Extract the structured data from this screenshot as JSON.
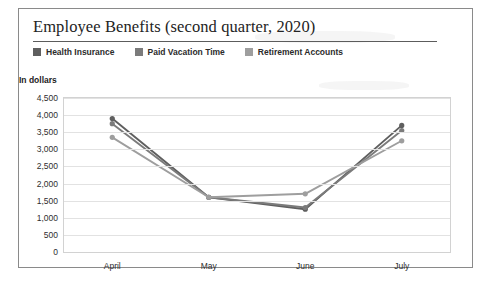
{
  "figure": {
    "title": "Employee Benefits (second quarter, 2020)",
    "axis_note": "In dollars"
  },
  "colors": {
    "health_insurance": "#5f5f5f",
    "paid_vacation_time": "#7b7b7b",
    "retirement_accounts": "#9e9e9e",
    "gridline": "#e2e2e2",
    "plot_border": "#d2d2d2",
    "frame_border": "#8a8a8a",
    "title_rule": "#5c5c5c",
    "text": "#2e2e2e"
  },
  "legend": {
    "position": "top",
    "items": [
      {
        "label": "Health Insurance",
        "color": "#5f5f5f"
      },
      {
        "label": "Paid Vacation Time",
        "color": "#7b7b7b"
      },
      {
        "label": "Retirement Accounts",
        "color": "#9e9e9e"
      }
    ]
  },
  "chart_data": {
    "type": "line",
    "title": "Employee Benefits (second quarter, 2020)",
    "xlabel": "",
    "ylabel": "In dollars",
    "categories": [
      "April",
      "May",
      "June",
      "July"
    ],
    "series": [
      {
        "name": "Health Insurance",
        "values": [
          3900,
          1600,
          1250,
          3700
        ]
      },
      {
        "name": "Paid Vacation Time",
        "values": [
          3750,
          1600,
          1300,
          3550
        ]
      },
      {
        "name": "Retirement Accounts",
        "values": [
          3350,
          1600,
          1700,
          3250
        ]
      }
    ],
    "ylim": [
      0,
      4500
    ],
    "yticks": [
      0,
      500,
      1000,
      1500,
      2000,
      2500,
      3000,
      3500,
      4000,
      4500
    ],
    "ytick_labels": [
      "0",
      "500",
      "1,000",
      "1,500",
      "2,000",
      "2,500",
      "3,000",
      "3,500",
      "4,000",
      "4,500"
    ],
    "grid": true,
    "markers": true,
    "legend_position": "top"
  }
}
